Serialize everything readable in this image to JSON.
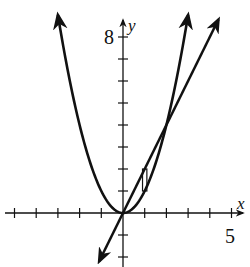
{
  "chart_data": {
    "type": "line",
    "title": "",
    "xlabel": "x",
    "ylabel": "y",
    "x_tick_label": "5",
    "y_tick_label": "8",
    "xlim": [
      -5.3,
      5.5
    ],
    "ylim": [
      -2.4,
      9.3
    ],
    "x_ticks": [
      -5,
      -4,
      -3,
      -2,
      -1,
      1,
      2,
      3,
      4,
      5
    ],
    "y_ticks": [
      -2,
      -1,
      1,
      2,
      3,
      4,
      5,
      6,
      7,
      8
    ],
    "grid": false,
    "series": [
      {
        "name": "parabola y = x^2",
        "expression": "x^2",
        "x_range": [
          -3,
          3
        ]
      },
      {
        "name": "line y = 2x",
        "expression": "2x",
        "x_range": [
          -1.1,
          4.4
        ]
      }
    ],
    "intersections": [
      [
        0,
        0
      ],
      [
        2,
        4
      ]
    ],
    "annotations": [
      {
        "type": "representative-rectangle",
        "x_range": [
          0.9,
          1.1
        ],
        "y_bottom": "x^2",
        "y_top": "2x"
      }
    ]
  },
  "labels": {
    "x_axis": "x",
    "y_axis": "y",
    "x_tick": "5",
    "y_tick": "8"
  },
  "colors": {
    "ink": "#111111",
    "background": "#ffffff"
  }
}
